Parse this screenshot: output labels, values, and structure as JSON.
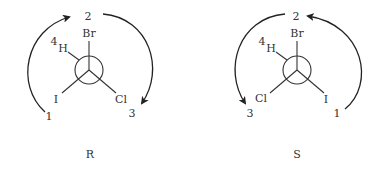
{
  "diagrams": [
    {
      "configuration": "R",
      "substituents": {
        "top": {
          "atom": "Br",
          "priority": "2"
        },
        "upper_left": {
          "atom": "H",
          "priority": "4"
        },
        "lower_left": {
          "atom": "I",
          "priority": "1"
        },
        "lower_right": {
          "atom": "Cl",
          "priority": "3"
        }
      },
      "rotation": "clockwise"
    },
    {
      "configuration": "S",
      "substituents": {
        "top": {
          "atom": "Br",
          "priority": "2"
        },
        "upper_left": {
          "atom": "H",
          "priority": "4"
        },
        "lower_left": {
          "atom": "Cl",
          "priority": "3"
        },
        "lower_right": {
          "atom": "I",
          "priority": "1"
        }
      },
      "rotation": "counterclockwise"
    }
  ],
  "colors": {
    "ink": "#333333",
    "background": "#ffffff"
  }
}
